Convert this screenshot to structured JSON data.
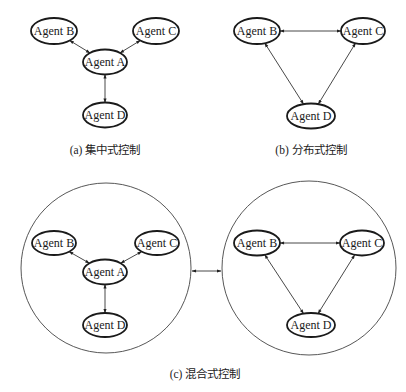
{
  "diagram": {
    "top_fragment_text": "",
    "panels": [
      {
        "id": "a",
        "caption": "(a) 集中式控制",
        "type": "centralized",
        "nodes": [
          {
            "id": "B",
            "label": "Agent B",
            "cx": 54,
            "cy": 31,
            "rx": 23,
            "ry": 13
          },
          {
            "id": "C",
            "label": "Agent C",
            "cx": 156,
            "cy": 31,
            "rx": 23,
            "ry": 13
          },
          {
            "id": "A",
            "label": "Agent A",
            "cx": 105,
            "cy": 62,
            "rx": 22,
            "ry": 12.5
          },
          {
            "id": "D",
            "label": "Agent D",
            "cx": 105,
            "cy": 115,
            "rx": 22,
            "ry": 12.5
          }
        ],
        "edges": [
          {
            "from": "B",
            "to": "A",
            "bidirectional": true
          },
          {
            "from": "C",
            "to": "A",
            "bidirectional": true
          },
          {
            "from": "A",
            "to": "D",
            "bidirectional": true
          }
        ],
        "caption_x": 105,
        "caption_y": 154
      },
      {
        "id": "b",
        "caption": "(b) 分布式控制",
        "type": "distributed",
        "nodes": [
          {
            "id": "B",
            "label": "Agent B",
            "cx": 257,
            "cy": 31,
            "rx": 23,
            "ry": 13
          },
          {
            "id": "C",
            "label": "Agent C",
            "cx": 363,
            "cy": 31,
            "rx": 22,
            "ry": 13
          },
          {
            "id": "D",
            "label": "Agent D",
            "cx": 311,
            "cy": 116,
            "rx": 24,
            "ry": 12.5
          }
        ],
        "edges": [
          {
            "from": "B",
            "to": "C",
            "bidirectional": true
          },
          {
            "from": "B",
            "to": "D",
            "bidirectional": true
          },
          {
            "from": "C",
            "to": "D",
            "bidirectional": true
          }
        ],
        "caption_x": 311,
        "caption_y": 154
      },
      {
        "id": "c",
        "caption": "(c) 混合式控制",
        "type": "hybrid",
        "caption_x": 205,
        "caption_y": 378,
        "groups": [
          {
            "id": "c-left",
            "circle": {
              "cx": 106,
              "cy": 268,
              "r": 85
            },
            "nodes": [
              {
                "id": "B",
                "label": "Agent B",
                "cx": 54,
                "cy": 243,
                "rx": 22,
                "ry": 12
              },
              {
                "id": "C",
                "label": "Agent C",
                "cx": 157,
                "cy": 243,
                "rx": 22,
                "ry": 12
              },
              {
                "id": "A",
                "label": "Agent A",
                "cx": 105,
                "cy": 272,
                "rx": 22,
                "ry": 12.5
              },
              {
                "id": "D",
                "label": "Agent D",
                "cx": 105,
                "cy": 325,
                "rx": 22,
                "ry": 12
              }
            ],
            "edges": [
              {
                "from": "B",
                "to": "A",
                "bidirectional": true
              },
              {
                "from": "C",
                "to": "A",
                "bidirectional": true
              },
              {
                "from": "A",
                "to": "D",
                "bidirectional": true
              }
            ]
          },
          {
            "id": "c-right",
            "circle": {
              "cx": 309,
              "cy": 268,
              "r": 87
            },
            "nodes": [
              {
                "id": "B",
                "label": "Agent B",
                "cx": 257,
                "cy": 243,
                "rx": 23,
                "ry": 12.5
              },
              {
                "id": "C",
                "label": "Agent C",
                "cx": 362,
                "cy": 243,
                "rx": 22,
                "ry": 12.5
              },
              {
                "id": "D",
                "label": "Agent D",
                "cx": 311,
                "cy": 325,
                "rx": 24,
                "ry": 12
              }
            ],
            "edges": [
              {
                "from": "B",
                "to": "C",
                "bidirectional": true
              },
              {
                "from": "B",
                "to": "D",
                "bidirectional": true
              },
              {
                "from": "C",
                "to": "D",
                "bidirectional": true
              }
            ]
          }
        ],
        "group_link": {
          "x1": 192,
          "y1": 271,
          "x2": 221,
          "y2": 271,
          "bidirectional": true
        }
      }
    ]
  },
  "colors": {
    "background": "#ffffff",
    "stroke": "#1a1a1a",
    "text": "#1a1a1a"
  }
}
